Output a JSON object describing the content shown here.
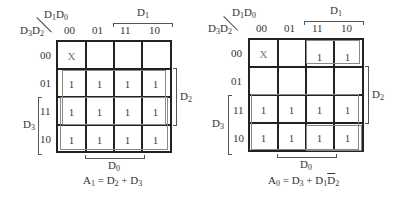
{
  "maps": [
    {
      "id": "A1",
      "col_var_label": "D1D0",
      "row_var_label": "D3D2",
      "col_headers": [
        "00",
        "01",
        "11",
        "10"
      ],
      "row_headers": [
        "00",
        "01",
        "11",
        "10"
      ],
      "cells": [
        [
          "X",
          "",
          "",
          ""
        ],
        [
          "1",
          "1",
          "1",
          "1"
        ],
        [
          "1",
          "1",
          "1",
          "1"
        ],
        [
          "1",
          "1",
          "1",
          "1"
        ]
      ],
      "top_bracket_label": "D1",
      "right_bracket_label": "D2",
      "left_bracket_label": "D3",
      "bottom_bracket_label": "D0",
      "equation": "A1 = D2 + D3"
    },
    {
      "id": "A0",
      "col_var_label": "D1D0",
      "row_var_label": "D3D2",
      "col_headers": [
        "00",
        "01",
        "11",
        "10"
      ],
      "row_headers": [
        "00",
        "01",
        "11",
        "10"
      ],
      "cells": [
        [
          "X",
          "",
          "1",
          "1"
        ],
        [
          "",
          "",
          "",
          ""
        ],
        [
          "1",
          "1",
          "1",
          "1"
        ],
        [
          "1",
          "1",
          "1",
          "1"
        ]
      ],
      "top_bracket_label": "D1",
      "right_bracket_label": "D2",
      "left_bracket_label": "D3",
      "bottom_bracket_label": "D0",
      "equation": "A0 = D3 + D1D̄2"
    }
  ]
}
